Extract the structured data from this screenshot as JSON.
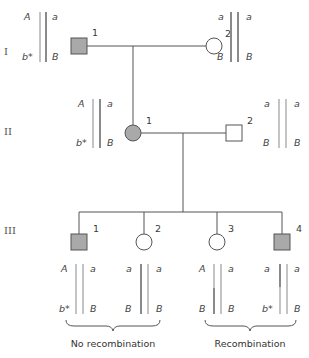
{
  "colors": {
    "affected_fill": "#a9a9a9",
    "unaffected_fill": "#ffffff",
    "outline": "#555555",
    "chrom_dark": "#8a8a8a",
    "chrom_light": "#c4c4c4"
  },
  "generations": [
    {
      "label": "I"
    },
    {
      "label": "II"
    },
    {
      "label": "III"
    }
  ],
  "individuals": {
    "I1": {
      "number": "1",
      "sex": "male",
      "affected": true
    },
    "I2": {
      "number": "2",
      "sex": "female",
      "affected": false
    },
    "II1": {
      "number": "1",
      "sex": "female",
      "affected": true
    },
    "II2": {
      "number": "2",
      "sex": "male",
      "affected": false
    },
    "III1": {
      "number": "1",
      "sex": "male",
      "affected": true
    },
    "III2": {
      "number": "2",
      "sex": "female",
      "affected": false
    },
    "III3": {
      "number": "3",
      "sex": "female",
      "affected": false
    },
    "III4": {
      "number": "4",
      "sex": "male",
      "affected": true
    }
  },
  "haplotypes": {
    "I1": {
      "left_top": "A",
      "left_bottom": "b*",
      "right_top": "a",
      "right_bottom": "B"
    },
    "I2": {
      "left_top": "a",
      "left_bottom": "B",
      "right_top": "a",
      "right_bottom": "B"
    },
    "II1": {
      "left_top": "A",
      "left_bottom": "b*",
      "right_top": "a",
      "right_bottom": "B"
    },
    "II2": {
      "left_top": "a",
      "left_bottom": "B",
      "right_top": "a",
      "right_bottom": "B"
    },
    "III1": {
      "left_top": "A",
      "left_bottom": "b*",
      "right_top": "a",
      "right_bottom": "B"
    },
    "III2": {
      "left_top": "a",
      "left_bottom": "B",
      "right_top": "a",
      "right_bottom": "B"
    },
    "III3": {
      "left_top": "A",
      "left_bottom": "B",
      "right_top": "a",
      "right_bottom": "B"
    },
    "III4": {
      "left_top": "a",
      "left_bottom": "b*",
      "right_top": "a",
      "right_bottom": "B"
    }
  },
  "captions": {
    "no_recombination": "No recombination",
    "recombination": "Recombination"
  }
}
